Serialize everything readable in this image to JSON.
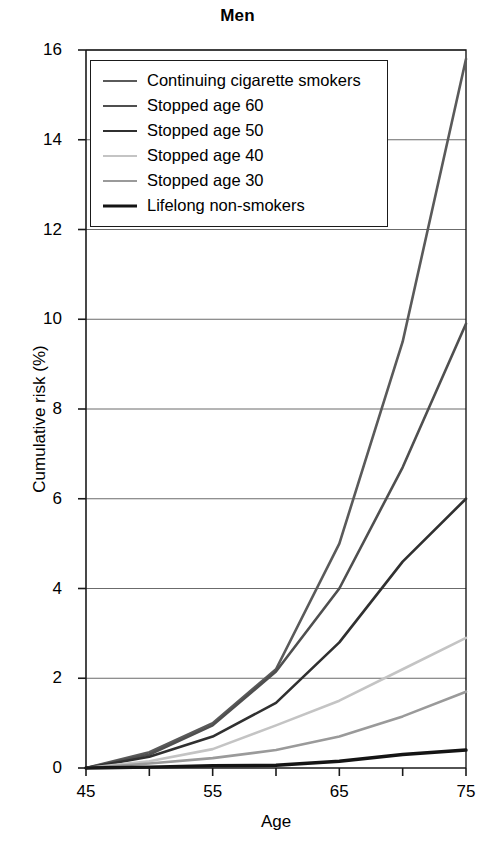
{
  "chart_data": {
    "type": "line",
    "title": "Men",
    "xlabel": "Age",
    "ylabel": "Cumulative risk (%)",
    "xlim": [
      45,
      75
    ],
    "ylim": [
      0,
      16
    ],
    "xticks": [
      45,
      55,
      65,
      75
    ],
    "xticks_minor": [
      50,
      60,
      70
    ],
    "yticks": [
      0,
      2,
      4,
      6,
      8,
      10,
      12,
      14,
      16
    ],
    "grid": "horizontal",
    "legend_position": "top-left",
    "x": [
      45,
      50,
      55,
      60,
      65,
      70,
      75
    ],
    "series": [
      {
        "name": "Continuing cigarette smokers",
        "color": "#5a5a5a",
        "width": 2.6,
        "values": [
          0,
          0.35,
          1.0,
          2.2,
          5.0,
          9.5,
          15.8
        ]
      },
      {
        "name": "Stopped age 60",
        "color": "#4f4f4f",
        "width": 2.6,
        "values": [
          0,
          0.3,
          0.95,
          2.15,
          4.0,
          6.7,
          9.9
        ]
      },
      {
        "name": "Stopped age 50",
        "color": "#303030",
        "width": 2.6,
        "values": [
          0,
          0.25,
          0.7,
          1.45,
          2.8,
          4.6,
          6.0
        ]
      },
      {
        "name": "Stopped age 40",
        "color": "#c4c4c4",
        "width": 2.6,
        "values": [
          0,
          0.15,
          0.42,
          0.95,
          1.5,
          2.2,
          2.9
        ]
      },
      {
        "name": "Stopped age 30",
        "color": "#9a9a9a",
        "width": 2.6,
        "values": [
          0,
          0.1,
          0.22,
          0.4,
          0.7,
          1.15,
          1.7
        ]
      },
      {
        "name": "Lifelong non-smokers",
        "color": "#141414",
        "width": 3.4,
        "values": [
          0,
          0.02,
          0.05,
          0.06,
          0.15,
          0.3,
          0.4
        ]
      }
    ]
  },
  "axes": {
    "y_tick_labels": [
      "16",
      "14",
      "12",
      "10",
      "8",
      "6",
      "4",
      "2",
      "0"
    ],
    "x_tick_labels": [
      "45",
      "55",
      "65",
      "75"
    ]
  },
  "legend": {
    "items": [
      {
        "label": "Continuing cigarette smokers"
      },
      {
        "label": "Stopped age 60"
      },
      {
        "label": "Stopped age 50"
      },
      {
        "label": "Stopped age 40"
      },
      {
        "label": "Stopped age 30"
      },
      {
        "label": "Lifelong non-smokers"
      }
    ]
  },
  "colors": {
    "axis": "#1a1a1a",
    "grid": "#6b6b6b",
    "background": "#ffffff"
  }
}
